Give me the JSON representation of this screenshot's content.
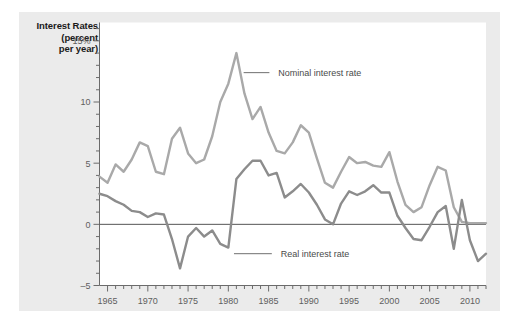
{
  "figure": {
    "panel_bg": "#ebebeb",
    "page_bg": "#ffffff",
    "plot_bg": "#ffffff"
  },
  "axis_title": {
    "line1": "Interest Rates",
    "line2": "(percent",
    "line3": "per year)"
  },
  "annotations": [
    {
      "name": "nominal-label",
      "text": "Nominal interest rate"
    },
    {
      "name": "real-label",
      "text": "Real interest rate"
    }
  ],
  "chart_data": {
    "type": "line",
    "title": "",
    "subtitle": "",
    "xlabel": "",
    "ylabel": "Interest Rates (percent per year)",
    "xlim": [
      1964,
      2012
    ],
    "ylim": [
      -5,
      16.5
    ],
    "xticks": [
      1965,
      1970,
      1975,
      1980,
      1985,
      1990,
      1995,
      2000,
      2005,
      2010
    ],
    "xtick_labels": [
      "1965",
      "1970",
      "1975",
      "1980",
      "1985",
      "1990",
      "1995",
      "2000",
      "2005",
      "2010"
    ],
    "xminor_step": 1,
    "yticks": [
      -5,
      0,
      5,
      10,
      15
    ],
    "ytick_labels": [
      "–5",
      "0",
      "5",
      "10",
      "15%"
    ],
    "yminor_step": 1,
    "grid": false,
    "zero_line": 0,
    "zero_line_color": "#555555",
    "legend_position": "inline-annotations",
    "series": [
      {
        "name": "Nominal interest rate",
        "color": "#a9a9a9",
        "width": 2.4,
        "x": [
          1964,
          1965,
          1966,
          1967,
          1968,
          1969,
          1970,
          1971,
          1972,
          1973,
          1974,
          1975,
          1976,
          1977,
          1978,
          1979,
          1980,
          1981,
          1982,
          1983,
          1984,
          1985,
          1986,
          1987,
          1988,
          1989,
          1990,
          1991,
          1992,
          1993,
          1994,
          1995,
          1996,
          1997,
          1998,
          1999,
          2000,
          2001,
          2002,
          2003,
          2004,
          2005,
          2006,
          2007,
          2008,
          2009,
          2010,
          2011,
          2012
        ],
        "values": [
          3.9,
          3.4,
          4.9,
          4.3,
          5.3,
          6.7,
          6.4,
          4.3,
          4.1,
          7.0,
          7.9,
          5.8,
          5.0,
          5.3,
          7.2,
          10.0,
          11.5,
          14.0,
          10.7,
          8.6,
          9.6,
          7.5,
          6.0,
          5.8,
          6.7,
          8.1,
          7.5,
          5.4,
          3.4,
          3.0,
          4.3,
          5.5,
          5.0,
          5.1,
          4.8,
          4.7,
          5.9,
          3.5,
          1.6,
          1.0,
          1.4,
          3.2,
          4.7,
          4.4,
          1.4,
          0.2,
          0.1,
          0.1,
          0.1
        ]
      },
      {
        "name": "Real interest rate",
        "color": "#8c8c8c",
        "width": 2.4,
        "x": [
          1964,
          1965,
          1966,
          1967,
          1968,
          1969,
          1970,
          1971,
          1972,
          1973,
          1974,
          1975,
          1976,
          1977,
          1978,
          1979,
          1980,
          1981,
          1982,
          1983,
          1984,
          1985,
          1986,
          1987,
          1988,
          1989,
          1990,
          1991,
          1992,
          1993,
          1994,
          1995,
          1996,
          1997,
          1998,
          1999,
          2000,
          2001,
          2002,
          2003,
          2004,
          2005,
          2006,
          2007,
          2008,
          2009,
          2010,
          2011,
          2012
        ],
        "values": [
          2.5,
          2.3,
          1.9,
          1.6,
          1.1,
          1.0,
          0.6,
          0.9,
          0.8,
          -1.2,
          -3.6,
          -1.0,
          -0.3,
          -1.0,
          -0.5,
          -1.6,
          -1.9,
          3.7,
          4.5,
          5.2,
          5.2,
          4.0,
          4.2,
          2.2,
          2.7,
          3.3,
          2.6,
          1.6,
          0.4,
          0.0,
          1.7,
          2.7,
          2.4,
          2.7,
          3.2,
          2.6,
          2.6,
          0.7,
          -0.3,
          -1.2,
          -1.3,
          -0.2,
          1.0,
          1.5,
          -2.0,
          2.0,
          -1.3,
          -3.0,
          -2.4
        ]
      }
    ],
    "annotations": [
      {
        "label": "Nominal interest rate",
        "anchor_x": 1981,
        "anchor_y": 13.3,
        "leader_to_x": 1985.1,
        "leader_to_y": 12.4,
        "text_x": 1986.2,
        "text_y": 12.4
      },
      {
        "label": "Real interest rate",
        "anchor_x": 1980.3,
        "anchor_y": -2.4,
        "leader_to_x": 1985.4,
        "leader_to_y": -2.4,
        "text_x": 1986.5,
        "text_y": -2.4
      }
    ]
  }
}
